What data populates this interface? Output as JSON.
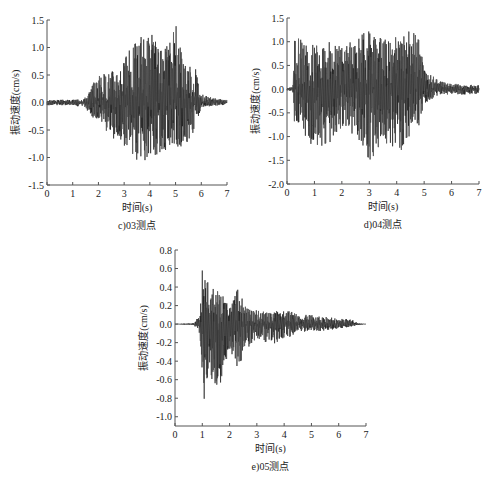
{
  "chart_data": [
    {
      "id": "c",
      "type": "line",
      "caption": "c)03测点",
      "xlabel": "时间(s)",
      "ylabel": "振动速度(cm/s)",
      "xlim": [
        0,
        7
      ],
      "ylim": [
        -1.5,
        1.5
      ],
      "xticks": [
        0,
        1,
        2,
        3,
        4,
        5,
        6,
        7
      ],
      "yticks": [
        1.5,
        1.0,
        0.5,
        0.0,
        -0.5,
        -1.0,
        -1.5
      ],
      "ytick_labels": [
        "1.5",
        "1.0",
        "0.5",
        "0.0",
        "-0.5",
        "-1.0",
        "-1.5"
      ],
      "grid": false,
      "description": "Vibration velocity time history; low noise 0-1.5s, strong burst 1.7-5.8s, decays to noise by 6-7s",
      "peak_max": 1.42,
      "peak_min": -1.1,
      "envelope": {
        "t": [
          0,
          1.0,
          1.5,
          1.8,
          2.0,
          2.5,
          3.0,
          3.5,
          4.0,
          4.5,
          5.0,
          5.5,
          5.8,
          6.0,
          6.5,
          7.0
        ],
        "pos": [
          0.05,
          0.05,
          0.1,
          0.35,
          0.5,
          0.6,
          0.8,
          1.2,
          1.35,
          0.9,
          1.42,
          0.7,
          0.6,
          0.15,
          0.08,
          0.05
        ],
        "neg": [
          -0.05,
          -0.05,
          -0.1,
          -0.3,
          -0.4,
          -0.65,
          -0.8,
          -1.05,
          -1.1,
          -0.9,
          -0.85,
          -0.8,
          -0.4,
          -0.1,
          -0.06,
          -0.04
        ]
      },
      "frame": {
        "x0": 47,
        "x1": 227,
        "y_top": 20,
        "y_bottom": 185
      },
      "seed": 3
    },
    {
      "id": "d",
      "type": "line",
      "caption": "d)04测点",
      "xlabel": "时间(s)",
      "ylabel": "振动速度(cm/s)",
      "xlim": [
        0,
        7
      ],
      "ylim": [
        -2.0,
        1.5
      ],
      "xticks": [
        0,
        1,
        2,
        3,
        4,
        5,
        6,
        7
      ],
      "yticks": [
        1.5,
        1.0,
        0.5,
        0.0,
        -0.5,
        -1.0,
        -1.5,
        -2.0
      ],
      "ytick_labels": [
        "1.5",
        "1.0",
        "0.5",
        "0.0",
        "-0.5",
        "-1.0",
        "-1.5",
        "-2.0"
      ],
      "grid": false,
      "description": "Vibration velocity time history; quiet until 0.2s, strong oscillation 0.2-4.9s, small residual 5-7s",
      "peak_max": 1.33,
      "peak_min": -1.58,
      "envelope": {
        "t": [
          0,
          0.2,
          0.3,
          0.5,
          1.0,
          1.5,
          2.0,
          2.5,
          3.0,
          3.5,
          4.0,
          4.5,
          4.8,
          5.0,
          5.5,
          6.0,
          6.5,
          7.0
        ],
        "pos": [
          0.03,
          0.05,
          1.33,
          1.1,
          0.95,
          1.0,
          0.9,
          1.05,
          1.3,
          1.1,
          1.1,
          1.25,
          1.2,
          0.4,
          0.2,
          0.12,
          0.1,
          0.08
        ],
        "neg": [
          -0.03,
          -0.05,
          -1.0,
          -0.9,
          -1.25,
          -1.3,
          -0.8,
          -1.0,
          -1.58,
          -1.1,
          -1.38,
          -1.1,
          -0.8,
          -0.3,
          -0.15,
          -0.1,
          -0.12,
          -0.1
        ]
      },
      "frame": {
        "x0": 287,
        "x1": 479,
        "y_top": 18,
        "y_bottom": 184
      },
      "seed": 4
    },
    {
      "id": "e",
      "type": "line",
      "caption": "e)05测点",
      "xlabel": "时间(s)",
      "ylabel": "振动速度(cm/s)",
      "xlim": [
        0,
        7
      ],
      "ylim": [
        -1.1,
        0.8
      ],
      "xticks": [
        0,
        1,
        2,
        3,
        4,
        5,
        6,
        7
      ],
      "yticks": [
        0.8,
        0.6,
        0.4,
        0.2,
        0.0,
        -0.2,
        -0.4,
        -0.6,
        -0.8,
        -1.0
      ],
      "ytick_labels": [
        "0.8",
        "0.6",
        "0.4",
        "0.2",
        "0.0",
        "-0.2",
        "-0.4",
        "-0.6",
        "-0.8",
        "-1.0"
      ],
      "grid": false,
      "description": "Vibration velocity time history; onset ~0.8s, max spike ~1.0s (0.65 / -0.88), exponential decay to ~6.6s",
      "peak_max": 0.65,
      "peak_min": -0.88,
      "envelope": {
        "t": [
          0,
          0.7,
          0.9,
          1.0,
          1.3,
          1.6,
          2.0,
          2.3,
          2.6,
          3.0,
          3.5,
          4.0,
          4.5,
          5.0,
          5.5,
          6.0,
          6.5,
          6.7,
          7.0
        ],
        "pos": [
          0.0,
          0.01,
          0.1,
          0.65,
          0.42,
          0.38,
          0.2,
          0.4,
          0.18,
          0.15,
          0.12,
          0.18,
          0.1,
          0.1,
          0.09,
          0.06,
          0.05,
          0.01,
          0.0
        ],
        "neg": [
          0.0,
          -0.01,
          -0.15,
          -0.88,
          -0.65,
          -0.7,
          -0.35,
          -0.48,
          -0.28,
          -0.15,
          -0.22,
          -0.18,
          -0.1,
          -0.08,
          -0.07,
          -0.05,
          -0.03,
          -0.01,
          0.0
        ]
      },
      "frame": {
        "x0": 175,
        "x1": 366,
        "y_top": 250,
        "y_bottom": 426
      },
      "seed": 5
    }
  ],
  "colors": {
    "axis": "#555555",
    "trace": "#111111",
    "trace_light": "#777777",
    "text": "#222222"
  }
}
